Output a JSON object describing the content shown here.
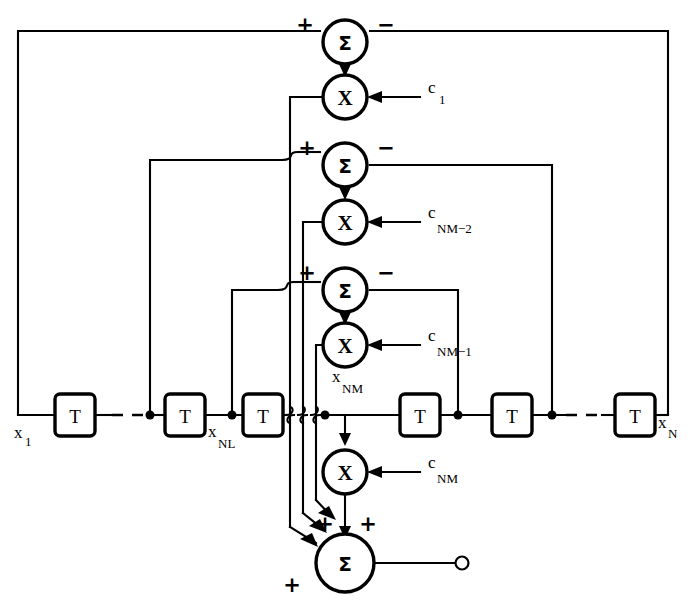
{
  "diagram": {
    "colors": {
      "line": "#000000",
      "background": "#ffffff",
      "fill": "#ffffff"
    },
    "glyphs": {
      "summer": "Σ",
      "multiplier": "X",
      "delay": "T",
      "plus": "+",
      "minus": "−"
    },
    "stages": [
      {
        "id": "stage-1",
        "summer_label": "Σ",
        "summer_left_sign": "+",
        "summer_right_sign": "−",
        "multiplier_label": "X",
        "coefficient_base": "c",
        "coefficient_sub": "1"
      },
      {
        "id": "stage-2",
        "summer_label": "Σ",
        "summer_left_sign": "+",
        "summer_right_sign": "−",
        "multiplier_label": "X",
        "coefficient_base": "c",
        "coefficient_sub": "NM−2"
      },
      {
        "id": "stage-3",
        "summer_label": "Σ",
        "summer_left_sign": "+",
        "summer_right_sign": "−",
        "multiplier_label": "X",
        "coefficient_base": "c",
        "coefficient_sub": "NM−1"
      }
    ],
    "output_stage": {
      "id": "output-stage",
      "multiplier_label": "X",
      "coefficient_base": "c",
      "coefficient_sub": "NM",
      "summer_label": "Σ",
      "summer_signs": [
        "+",
        "+",
        "+"
      ]
    },
    "delay_line": {
      "block_label": "T",
      "blocks": [
        {
          "id": "delay-1",
          "label": "T"
        },
        {
          "id": "delay-2",
          "label": "T"
        },
        {
          "id": "delay-3",
          "label": "T"
        },
        {
          "id": "delay-4",
          "label": "T"
        },
        {
          "id": "delay-5",
          "label": "T"
        },
        {
          "id": "delay-6",
          "label": "T"
        }
      ],
      "signal_labels": [
        {
          "id": "x1",
          "base": "x",
          "sub": "1"
        },
        {
          "id": "xNL",
          "base": "x",
          "sub": "NL"
        },
        {
          "id": "xNM",
          "base": "x",
          "sub": "NM"
        },
        {
          "id": "xN",
          "base": "x",
          "sub": "N"
        }
      ]
    }
  }
}
